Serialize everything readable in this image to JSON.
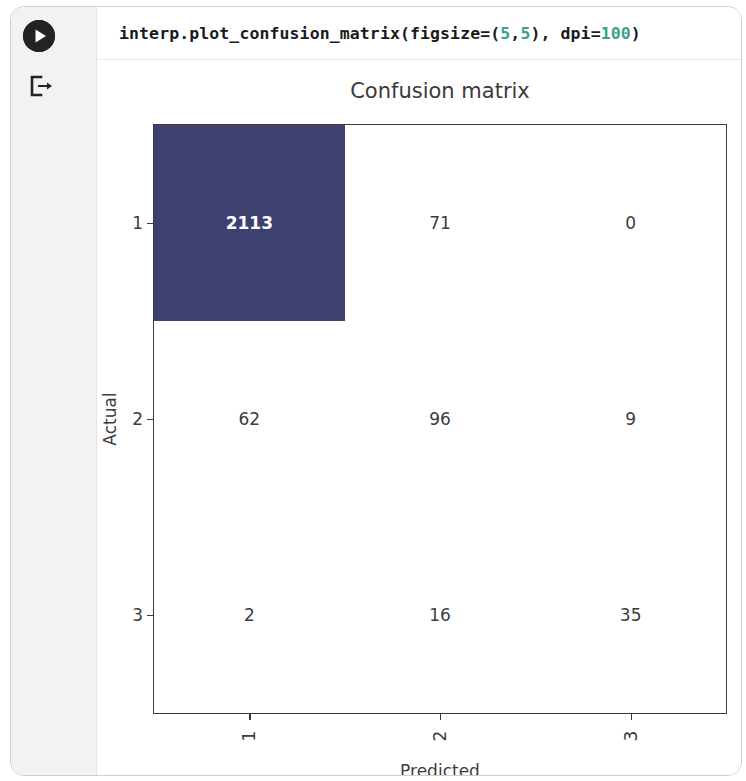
{
  "cell": {
    "run_icon": "play-icon",
    "output_icon": "output-arrow-icon",
    "code": {
      "part1": "interp.plot_confusion_matrix(figsize=(",
      "num1": "5",
      "comma": ",",
      "num2": "5",
      "part2": "), dpi=",
      "num3": "100",
      "part3": ")",
      "full": "interp.plot_confusion_matrix(figsize=(5,5), dpi=100)"
    }
  },
  "colors": {
    "dark_cell": "#3e4070",
    "code_number": "#3f9d8e",
    "axis": "#3a3a3a",
    "text": "#3c3c3c",
    "gutter": "#f2f2f2"
  },
  "chart_data": {
    "type": "heatmap",
    "title": "Confusion matrix",
    "xlabel": "Predicted",
    "ylabel": "Actual",
    "xticklabels": [
      "1",
      "2",
      "3"
    ],
    "yticklabels": [
      "1",
      "2",
      "3"
    ],
    "rows": [
      {
        "label": "1",
        "cells": [
          {
            "value": "2113",
            "highlighted": true
          },
          {
            "value": "71",
            "highlighted": false
          },
          {
            "value": "0",
            "highlighted": false
          }
        ]
      },
      {
        "label": "2",
        "cells": [
          {
            "value": "62",
            "highlighted": false
          },
          {
            "value": "96",
            "highlighted": false
          },
          {
            "value": "9",
            "highlighted": false
          }
        ]
      },
      {
        "label": "3",
        "cells": [
          {
            "value": "2",
            "highlighted": false
          },
          {
            "value": "16",
            "highlighted": false
          },
          {
            "value": "35",
            "highlighted": false
          }
        ]
      }
    ],
    "values": [
      [
        2113,
        71,
        0
      ],
      [
        62,
        96,
        9
      ],
      [
        2,
        16,
        35
      ]
    ],
    "colormap": "Blues-like (white to dark navy)",
    "vmin": 0,
    "vmax": 2113,
    "grid": false,
    "legend": "none"
  }
}
